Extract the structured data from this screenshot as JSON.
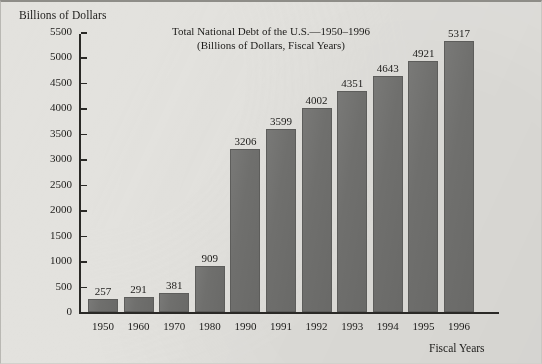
{
  "figure": {
    "y_axis_caption": "Billions of Dollars",
    "x_axis_caption": "Fiscal Years",
    "title_line1": "Total National Debt of the U.S.—1950–1996",
    "title_line2": "(Billions of Dollars, Fiscal Years)"
  },
  "colors": {
    "bar_fill": "#6f6f6d",
    "bar_edge": "#5d5d5b",
    "axis": "#2a2926",
    "background": "#e3e2de",
    "text": "#1d1c1a"
  },
  "chart_data": {
    "type": "bar",
    "title": "Total National Debt of the U.S.—1950–1996",
    "subtitle": "(Billions of Dollars, Fiscal Years)",
    "xlabel": "Fiscal Years",
    "ylabel": "Billions of Dollars",
    "categories": [
      "1950",
      "1960",
      "1970",
      "1980",
      "1990",
      "1991",
      "1992",
      "1993",
      "1994",
      "1995",
      "1996"
    ],
    "values": [
      257,
      291,
      381,
      909,
      3206,
      3599,
      4002,
      4351,
      4643,
      4921,
      5317
    ],
    "data_labels": [
      "257",
      "291",
      "381",
      "909",
      "3206",
      "3599",
      "4002",
      "4351",
      "4643",
      "4921",
      "5317"
    ],
    "ylim": [
      0,
      5500
    ],
    "ytick_step": 500,
    "yticks": [
      0,
      500,
      1000,
      1500,
      2000,
      2500,
      3000,
      3500,
      4000,
      4500,
      5000,
      5500
    ],
    "ytick_labels": [
      "0",
      "500",
      "1000",
      "1500",
      "2000",
      "2500",
      "3000",
      "3500",
      "4000",
      "4500",
      "5000",
      "5500"
    ],
    "grid": false,
    "legend": false
  }
}
